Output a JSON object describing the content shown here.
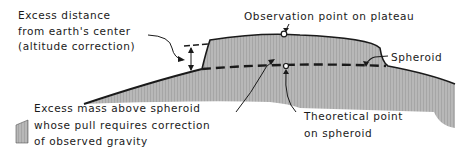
{
  "diagram": {
    "type": "cross-section",
    "labels": {
      "altitude": {
        "line1": "Excess distance",
        "line2": "from earth's center",
        "line3": "(altitude correction)"
      },
      "observation_point": "Observation point on plateau",
      "spheroid": "Spheroid",
      "excess_mass": {
        "line1": "Excess mass above spheroid",
        "line2": "whose pull requires correction",
        "line3": "of observed gravity"
      },
      "theoretical_point": {
        "line1": "Theoretical point",
        "line2": "on spheroid"
      }
    },
    "colors": {
      "fill": "#b4b4b4",
      "ink": "#1a1a1a",
      "background": "#ffffff"
    }
  }
}
